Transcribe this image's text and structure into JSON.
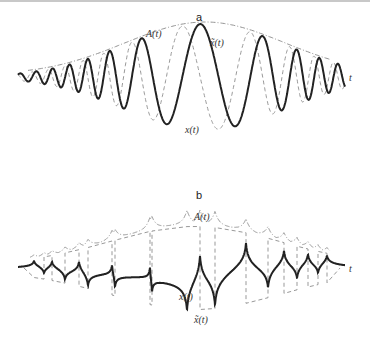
{
  "chart_data": [
    {
      "type": "line",
      "panel": "a",
      "title": "a",
      "xlabel": "t",
      "description": "Chirped oscillation with slowly varying envelope; its Hilbert transform is shifted by a quarter period",
      "series": [
        {
          "name": "A(t)",
          "label": "A(t)",
          "style": "dash-dot",
          "role": "envelope"
        },
        {
          "name": "x(t)",
          "label": "x(t)",
          "style": "dashed",
          "role": "signal"
        },
        {
          "name": "x̃(t)",
          "label": "x̃(t)",
          "style": "solid-bold",
          "role": "hilbert-transform"
        }
      ],
      "axis": {
        "y_px": 77,
        "x_start_px": 18,
        "x_end_px": 345
      },
      "envelope": {
        "center_px": 205,
        "width_px": 145,
        "peak_amp_px": 53
      },
      "oscillation": {
        "cycles_left_of_center": 8,
        "cycles_right_of_center": 6
      }
    },
    {
      "type": "line",
      "panel": "b",
      "title": "b",
      "xlabel": "t",
      "description": "Square-like wave x(t) with Hilbert transform x̃(t) showing logarithmic cusps at discontinuities; envelope A(t) with cusps",
      "series": [
        {
          "name": "A(t)",
          "label": "A(t)",
          "style": "dash-dot",
          "role": "envelope"
        },
        {
          "name": "x(t)",
          "label": "x(t)",
          "style": "dashed",
          "role": "signal"
        },
        {
          "name": "x̃(t)",
          "label": "x̃(t)",
          "style": "solid-bold",
          "role": "hilbert-transform"
        }
      ],
      "axis": {
        "y_px": 268,
        "x_start_px": 18,
        "x_end_px": 345
      }
    }
  ],
  "panels": {
    "a": {
      "label": "a",
      "labels": {
        "envelope": "A(t)",
        "hilbert": "x̃(t)",
        "signal": "x(t)",
        "axis": "t"
      }
    },
    "b": {
      "label": "b",
      "labels": {
        "envelope": "A(t)",
        "hilbert": "x̃(t)",
        "signal": "x(t)",
        "axis": "t"
      }
    }
  }
}
